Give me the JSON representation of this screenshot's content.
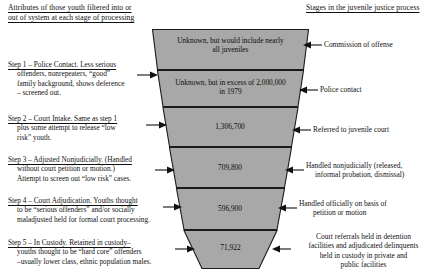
{
  "headers": {
    "left": [
      "Attributes of those youth filtered into or",
      "out of system at each stage of processing"
    ],
    "right": "Stages in the juvenile justice process"
  },
  "colors": {
    "funnel_fill": "#a8a8a8",
    "funnel_stroke": "#1a1a1a",
    "text": "#111111",
    "page_bg": "#ffffff"
  },
  "funnel": {
    "bands": [
      {
        "id": "band-1",
        "label": "Unknown, but would include nearly all juveniles",
        "lines": [
          "Unknown, but would include nearly",
          "all juveniles"
        ],
        "stage": "Commission of offense",
        "value": null
      },
      {
        "id": "band-2",
        "label": "Unknown, but in excess of 2,000,000 in 1979",
        "lines": [
          "Unknown, but in excess of 2,000,000",
          "in 1979"
        ],
        "stage": "Police contact",
        "value": null
      },
      {
        "id": "band-3",
        "label": "1,306,700",
        "lines": [
          "1,306,700"
        ],
        "stage": "Referred to juvenile court",
        "value": 1306700
      },
      {
        "id": "band-4",
        "label": "709,800",
        "lines": [
          "709,800"
        ],
        "stage": "Handled nonjudicially (released, informal probation, dismissal)",
        "value": 709800
      },
      {
        "id": "band-5",
        "label": "596,900",
        "lines": [
          "596,900"
        ],
        "stage": "Handled officially on basis of petition or motion",
        "value": 596900
      },
      {
        "id": "band-6",
        "label": "71,922",
        "lines": [
          "71,922"
        ],
        "stage": "Court referrals held in detention facilities and adjudicated delinquents held in custody in private and public facilities",
        "value": 71922
      }
    ]
  },
  "steps": [
    {
      "id": "step-1",
      "lead": "Step 1 – Police Contact.",
      "lines": [
        "Step 1 – Police Contact.  Less serious",
        "offenders, nonrepeaters, “good”",
        "family background, shows deference",
        "– screened out."
      ]
    },
    {
      "id": "step-2",
      "lead": "Step 2 – Court Intake.",
      "lines": [
        "Step 2 – Court Intake.  Same as step 1",
        "plus some attempt to release “low",
        "risk” youth."
      ]
    },
    {
      "id": "step-3",
      "lead": "Step 3 – Adjusted Nonjudicially.",
      "lines": [
        "Step 3 – Adjusted Nonjudicially.  (Handled",
        "without court petition or motion.)",
        "Attempt to screen out “low risk” cases."
      ]
    },
    {
      "id": "step-4",
      "lead": "Step 4 – Court Adjudication.",
      "lines": [
        "Step 4 – Court Adjudication.  Youths thought",
        "to be “serious offenders” and/or socially",
        "maladjusted held for formal court processing."
      ]
    },
    {
      "id": "step-5",
      "lead": "Step 5 – In Custody.",
      "lines": [
        "Step 5 – In Custody.  Retained in custody–",
        "youths thought to be “hard core” offenders",
        "–usually lower class, ethnic population males."
      ]
    }
  ],
  "stage_labels": [
    {
      "id": "stage-1",
      "lines": [
        "Commission of offense"
      ],
      "align": "left"
    },
    {
      "id": "stage-2",
      "lines": [
        "Police contact"
      ],
      "align": "left"
    },
    {
      "id": "stage-3",
      "lines": [
        "Referred to juvenile court"
      ],
      "align": "left"
    },
    {
      "id": "stage-4",
      "lines": [
        "Handled nonjudicially (released,",
        "informal probation, dismissal)"
      ],
      "align": "left"
    },
    {
      "id": "stage-5",
      "lines": [
        "Handled officially on basis of",
        "petition or motion"
      ],
      "align": "left"
    },
    {
      "id": "stage-6",
      "lines": [
        "Court referrals held in detention",
        "facilities and adjudicated delinquents",
        "held in custody in private and",
        "public facilities"
      ],
      "align": "center"
    }
  ]
}
